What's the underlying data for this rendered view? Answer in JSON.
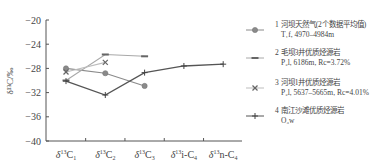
{
  "chart_data": {
    "type": "line",
    "title": "",
    "xlabel": "",
    "ylabel": "δ13C/‰",
    "ylabel_display": "δ¹³C/‰",
    "ylim": [
      -40,
      -20
    ],
    "yticks": [
      -20,
      -24,
      -28,
      -32,
      -36,
      -40
    ],
    "ytick_labels": [
      "−20",
      "−24",
      "−28",
      "−32",
      "−36",
      "−40"
    ],
    "categories": [
      "δ13C1",
      "δ13C2",
      "δ13C3",
      "δ13i-C4",
      "δ13n-C4"
    ],
    "category_labels": [
      {
        "pre": "δ",
        "sup": "13",
        "main": "C",
        "sub": "1"
      },
      {
        "pre": "δ",
        "sup": "13",
        "main": "C",
        "sub": "2"
      },
      {
        "pre": "δ",
        "sup": "13",
        "main": "C",
        "sub": "3"
      },
      {
        "pre": "δ",
        "sup": "13",
        "main": "i-C",
        "sub": "4"
      },
      {
        "pre": "δ",
        "sup": "13",
        "main": "n-C",
        "sub": "4"
      }
    ],
    "grid": false,
    "legend_position": "right",
    "series": [
      {
        "name": "1 河坝天然气(2个数据平均值) T1f, 4970–4984m",
        "marker": "circle",
        "color": "#8a8a8a",
        "values": [
          -28.0,
          -28.8,
          -30.9,
          null,
          null
        ]
      },
      {
        "name": "2 毛坝3井优质烃源岩 P2l, 6186m, Rc=3.72%",
        "marker": "dash",
        "color": "#a8a8a8",
        "values": [
          -30.0,
          -25.7,
          -26.0,
          null,
          null
        ]
      },
      {
        "name": "3 河坝1井优质烃源岩 P2l, 5637–5665m, Rc=4.01%",
        "marker": "x",
        "color": "#bdbdbd",
        "values": [
          -28.6,
          -27.0,
          null,
          null,
          null
        ]
      },
      {
        "name": "4 南江沙滩优质烃源岩 O3w",
        "marker": "plus",
        "color": "#555555",
        "values": [
          -30.1,
          -32.4,
          -28.7,
          -27.6,
          -27.3
        ]
      }
    ]
  },
  "legend": {
    "items": [
      {
        "line1": "1 河坝天然气(2个数据平均值)",
        "line2": "T₁f, 4970–4984m"
      },
      {
        "line1": "2 毛坝3井优质烃源岩",
        "line2": "P₂l, 6186m, Rc=3.72%"
      },
      {
        "line1": "3 河坝1井优质烃源岩",
        "line2": "P₂l, 5637–5665m, Rc=4.01%"
      },
      {
        "line1": "4 南江沙滩优质烃源岩",
        "line2": "O₃w"
      }
    ]
  }
}
